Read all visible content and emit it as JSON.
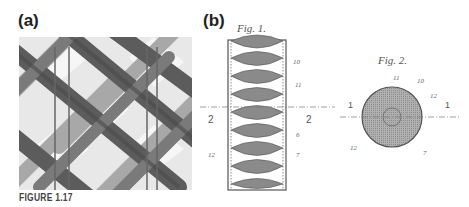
{
  "figure": {
    "caption": "FIGURE 1.17",
    "panels": [
      {
        "label": "(a)",
        "description": "photo of woven lattice structure"
      },
      {
        "label": "(b)",
        "drawings": [
          {
            "title": "Fig. 1.",
            "section_marks": [
              "2",
              "2"
            ],
            "callouts": [
              "10",
              "11",
              "6",
              "7",
              "12"
            ]
          },
          {
            "title": "Fig. 2.",
            "section_marks": [
              "1",
              "1"
            ],
            "callouts": [
              "11",
              "10",
              "12",
              "12",
              "7"
            ]
          }
        ]
      }
    ]
  }
}
